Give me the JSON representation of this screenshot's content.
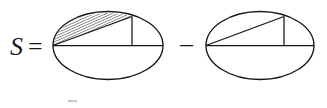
{
  "figure": {
    "kind": "geometry-equation-diagram",
    "background_color": "#ffffff",
    "ink_color": "#141414",
    "width": 327,
    "height": 108,
    "label": "S",
    "equals_sign": "=",
    "minus_sign": "–",
    "meaning": "Hatched elliptical segment area equals shaded-region figure minus triangle figure"
  },
  "terms": [
    {
      "name": "left-term",
      "description": "Ellipse with horizontal major axis, a chord from left vertex rising to upper right, a vertical drop line, and the region between chord and upper arc filled with diagonal hatching",
      "hatched": true,
      "ellipse": {
        "cx": 108,
        "cy": 45.5,
        "rx": 55,
        "ry": 34
      },
      "axis_line": {
        "x1": 53,
        "y1": 45.5,
        "x2": 163,
        "y2": 45.5
      },
      "chord_line": {
        "x1": 53,
        "y1": 45.5,
        "x2": 132,
        "y2": 16.5
      },
      "vertical_line": {
        "x1": 132,
        "y1": 16.5,
        "x2": 132,
        "y2": 45.5
      },
      "hatch_angle_deg": 66,
      "hatch_spacing_px": 2.4
    },
    {
      "name": "right-term",
      "description": "Ellipse with horizontal major axis, a chord from left vertex rising to upper right, and a vertical drop line; no hatching",
      "hatched": false,
      "ellipse": {
        "cx": 260,
        "cy": 45.5,
        "rx": 54,
        "ry": 34
      },
      "axis_line": {
        "x1": 206,
        "y1": 45.5,
        "x2": 314,
        "y2": 45.5
      },
      "chord_line": {
        "x1": 206,
        "y1": 45.5,
        "x2": 284,
        "y2": 16.5
      },
      "vertical_line": {
        "x1": 284,
        "y1": 16.5,
        "x2": 284,
        "y2": 45.5
      }
    }
  ],
  "text_positions": {
    "label_x": 10,
    "label_y": 55,
    "equals_x": 28,
    "equals_y": 55,
    "minus_x": 180,
    "minus_y": 52
  }
}
